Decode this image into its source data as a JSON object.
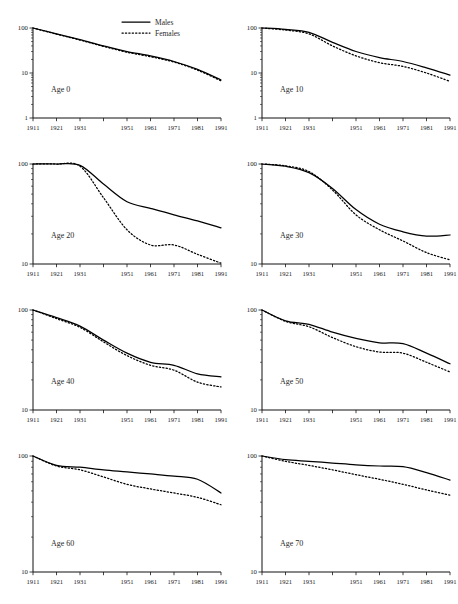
{
  "figure": {
    "background": "#ffffff",
    "ink": "#000000",
    "layout": "4 rows x 2 columns small multiples"
  },
  "legend": {
    "position": "top-right of first panel",
    "entries": [
      {
        "label": "Males",
        "style": "solid"
      },
      {
        "label": "Females",
        "style": "dotted"
      }
    ]
  },
  "chart_data": [
    {
      "type": "line",
      "title": "Age 0",
      "xlabel": "",
      "ylabel": "",
      "x": [
        1911,
        1921,
        1931,
        1941,
        1951,
        1961,
        1971,
        1981,
        1991
      ],
      "xtick_labels": [
        "1911",
        "1921",
        "1931",
        "",
        "1951",
        "1961",
        "1971",
        "1981",
        "1991"
      ],
      "ylim": [
        1,
        100
      ],
      "yscale": "log",
      "ytick_labels": [
        "1",
        "10",
        "100"
      ],
      "grid": false,
      "series": [
        {
          "name": "Males",
          "values": [
            100,
            74,
            55,
            40,
            30,
            24,
            18,
            12,
            7.0
          ]
        },
        {
          "name": "Females",
          "values": [
            100,
            73,
            54,
            39,
            29,
            23,
            17.5,
            11.6,
            6.7
          ]
        }
      ]
    },
    {
      "type": "line",
      "title": "Age 10",
      "xlabel": "",
      "ylabel": "",
      "x": [
        1911,
        1921,
        1931,
        1941,
        1951,
        1961,
        1971,
        1981,
        1991
      ],
      "xtick_labels": [
        "1911",
        "1921",
        "1931",
        "",
        "1951",
        "1961",
        "1971",
        "1981",
        "1991"
      ],
      "ylim": [
        1,
        100
      ],
      "yscale": "log",
      "ytick_labels": [
        "1",
        "10",
        "100"
      ],
      "grid": false,
      "series": [
        {
          "name": "Males",
          "values": [
            100,
            93,
            80,
            48,
            30,
            22,
            18,
            13,
            9.0
          ]
        },
        {
          "name": "Females",
          "values": [
            100,
            90,
            74,
            40,
            24,
            17,
            14,
            10,
            6.5
          ]
        }
      ]
    },
    {
      "type": "line",
      "title": "Age 20",
      "xlabel": "",
      "ylabel": "",
      "x": [
        1911,
        1921,
        1931,
        1941,
        1951,
        1961,
        1971,
        1981,
        1991
      ],
      "xtick_labels": [
        "1911",
        "1921",
        "1931",
        "",
        "1951",
        "1961",
        "1971",
        "1981",
        "1991"
      ],
      "ylim": [
        10,
        100
      ],
      "yscale": "log",
      "ytick_labels": [
        "10",
        "100"
      ],
      "grid": false,
      "series": [
        {
          "name": "Males",
          "values": [
            100,
            100,
            97,
            63,
            42,
            36,
            31,
            27,
            23
          ]
        },
        {
          "name": "Females",
          "values": [
            100,
            100,
            95,
            46,
            22,
            15.5,
            15.5,
            12.5,
            10.2
          ]
        }
      ]
    },
    {
      "type": "line",
      "title": "Age 30",
      "xlabel": "",
      "ylabel": "",
      "x": [
        1911,
        1921,
        1931,
        1941,
        1951,
        1961,
        1971,
        1981,
        1991
      ],
      "xtick_labels": [
        "1911",
        "1921",
        "1931",
        "",
        "1951",
        "1961",
        "1971",
        "1981",
        "1991"
      ],
      "ylim": [
        10,
        100
      ],
      "yscale": "log",
      "ytick_labels": [
        "10",
        "100"
      ],
      "grid": false,
      "series": [
        {
          "name": "Males",
          "values": [
            100,
            95,
            82,
            57,
            35,
            25,
            21,
            19,
            19.5
          ]
        },
        {
          "name": "Females",
          "values": [
            100,
            96,
            84,
            55,
            31,
            22,
            17,
            13,
            11
          ]
        }
      ]
    },
    {
      "type": "line",
      "title": "Age 40",
      "xlabel": "",
      "ylabel": "",
      "x": [
        1911,
        1921,
        1931,
        1941,
        1951,
        1961,
        1971,
        1981,
        1991
      ],
      "xtick_labels": [
        "1911",
        "1921",
        "1931",
        "",
        "1951",
        "1961",
        "1971",
        "1981",
        "1991"
      ],
      "ylim": [
        10,
        100
      ],
      "yscale": "log",
      "ytick_labels": [
        "10",
        "100"
      ],
      "grid": false,
      "series": [
        {
          "name": "Males",
          "values": [
            100,
            84,
            69,
            50,
            37,
            30,
            28,
            23,
            21.5
          ]
        },
        {
          "name": "Females",
          "values": [
            100,
            82,
            67,
            48,
            35,
            28,
            25,
            19,
            17
          ]
        }
      ]
    },
    {
      "type": "line",
      "title": "Age 50",
      "xlabel": "",
      "ylabel": "",
      "x": [
        1911,
        1921,
        1931,
        1941,
        1951,
        1961,
        1971,
        1981,
        1991
      ],
      "xtick_labels": [
        "1911",
        "1921",
        "1931",
        "",
        "1951",
        "1961",
        "1971",
        "1981",
        "1991"
      ],
      "ylim": [
        10,
        100
      ],
      "yscale": "log",
      "ytick_labels": [
        "10",
        "100"
      ],
      "grid": false,
      "series": [
        {
          "name": "Males",
          "values": [
            100,
            78,
            72,
            60,
            52,
            47,
            46,
            37,
            29
          ]
        },
        {
          "name": "Females",
          "values": [
            100,
            77,
            68,
            53,
            43,
            38,
            37,
            30,
            24
          ]
        }
      ]
    },
    {
      "type": "line",
      "title": "Age 60",
      "xlabel": "",
      "ylabel": "",
      "x": [
        1911,
        1921,
        1931,
        1941,
        1951,
        1961,
        1971,
        1981,
        1991
      ],
      "xtick_labels": [
        "1911",
        "1921",
        "1931",
        "",
        "1951",
        "1961",
        "1971",
        "1981",
        "1991"
      ],
      "ylim": [
        10,
        100
      ],
      "yscale": "log",
      "ytick_labels": [
        "10",
        "100"
      ],
      "grid": false,
      "series": [
        {
          "name": "Males",
          "values": [
            100,
            83,
            80,
            76,
            73,
            70,
            67,
            63,
            48
          ]
        },
        {
          "name": "Females",
          "values": [
            100,
            82,
            76,
            66,
            57,
            52,
            48,
            44,
            38
          ]
        }
      ]
    },
    {
      "type": "line",
      "title": "Age 70",
      "xlabel": "",
      "ylabel": "",
      "x": [
        1911,
        1921,
        1931,
        1941,
        1951,
        1961,
        1971,
        1981,
        1991
      ],
      "xtick_labels": [
        "1911",
        "1921",
        "1931",
        "",
        "1951",
        "1961",
        "1971",
        "1981",
        "1991"
      ],
      "ylim": [
        10,
        100
      ],
      "yscale": "log",
      "ytick_labels": [
        "10",
        "100"
      ],
      "grid": false,
      "series": [
        {
          "name": "Males",
          "values": [
            100,
            93,
            90,
            87,
            84,
            82,
            81,
            72,
            62
          ]
        },
        {
          "name": "Females",
          "values": [
            100,
            90,
            83,
            76,
            69,
            63,
            57,
            51,
            46
          ]
        }
      ]
    }
  ]
}
